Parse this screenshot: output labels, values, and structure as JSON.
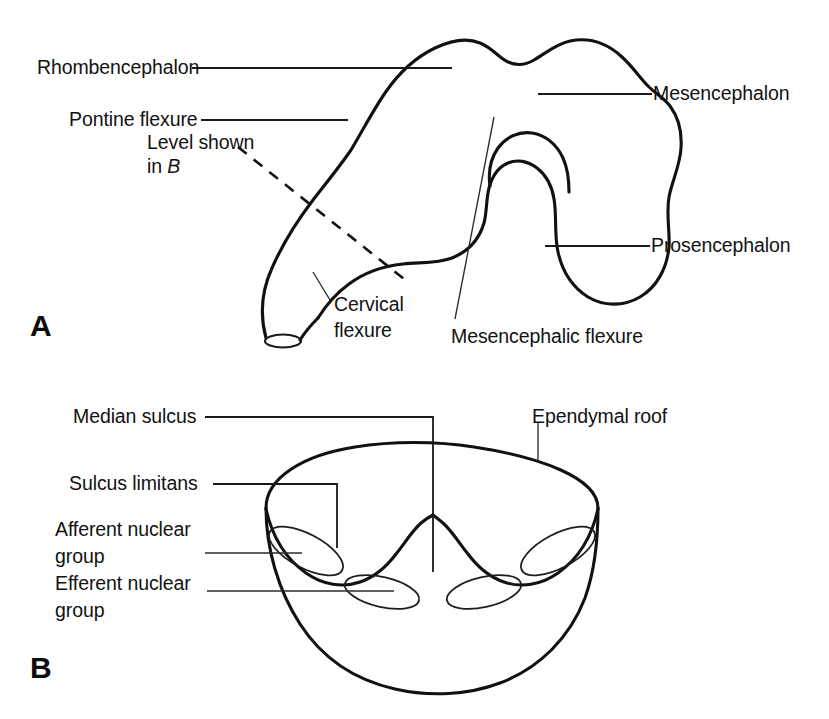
{
  "figure": {
    "panels": [
      {
        "letter": "A",
        "name": "embryonic-brain-lateral-view",
        "labels": [
          {
            "id": "rhombencephalon",
            "text": "Rhombencephalon"
          },
          {
            "id": "pontine-flexure",
            "text": "Pontine flexure"
          },
          {
            "id": "level-shown-line1",
            "text": "Level shown"
          },
          {
            "id": "level-shown-line2-prefix",
            "text": "in "
          },
          {
            "id": "level-shown-line2-italic",
            "text": "B"
          },
          {
            "id": "cervical-flexure-line1",
            "text": "Cervical"
          },
          {
            "id": "cervical-flexure-line2",
            "text": "flexure"
          },
          {
            "id": "mesencephalon",
            "text": "Mesencephalon"
          },
          {
            "id": "prosencephalon",
            "text": "Prosencephalon"
          },
          {
            "id": "mesencephalic-flexure",
            "text": "Mesencephalic flexure"
          }
        ]
      },
      {
        "letter": "B",
        "name": "rhombencephalon-floor-cross-section",
        "labels": [
          {
            "id": "median-sulcus",
            "text": "Median sulcus"
          },
          {
            "id": "sulcus-limitans",
            "text": "Sulcus limitans"
          },
          {
            "id": "afferent-nuclear-group-line1",
            "text": "Afferent nuclear"
          },
          {
            "id": "afferent-nuclear-group-line2",
            "text": "group"
          },
          {
            "id": "efferent-nuclear-group-line1",
            "text": "Efferent nuclear"
          },
          {
            "id": "efferent-nuclear-group-line2",
            "text": "group"
          },
          {
            "id": "ependymal-roof",
            "text": "Ependymal roof"
          }
        ]
      }
    ]
  },
  "colors": {
    "background": "#ffffff",
    "ink": "#111111",
    "text": "#121212",
    "leader": "#2b2b2b"
  }
}
